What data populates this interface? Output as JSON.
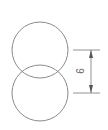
{
  "diagram": {
    "stroke_color": "#8a8a8a",
    "circles": [
      {
        "name": "upper-circle",
        "cx": 40,
        "cy": 50,
        "r": 28
      },
      {
        "name": "lower-circle",
        "cx": 40,
        "cy": 93,
        "r": 28
      }
    ],
    "dimension": {
      "label": "6",
      "orientation": "vertical",
      "from_y": 50,
      "to_y": 93
    }
  }
}
